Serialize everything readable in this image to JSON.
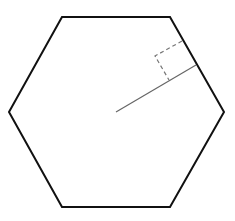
{
  "diagram": {
    "title": "",
    "shape": "regular-hexagon",
    "background": "#ffffff",
    "hexagon": {
      "vertices": [
        [
          62,
          17
        ],
        [
          170,
          17
        ],
        [
          224,
          112
        ],
        [
          170,
          207
        ],
        [
          62,
          207
        ],
        [
          9,
          112
        ]
      ],
      "stroke": "#111111",
      "stroke_width": 2
    },
    "apothem": {
      "from": [
        116,
        112
      ],
      "to": [
        196,
        65
      ],
      "stroke": "#666666",
      "stroke_width": 1.2
    },
    "right_angle_marker": {
      "points": [
        [
          182,
          41
        ],
        [
          155,
          56
        ],
        [
          169,
          80
        ]
      ],
      "stroke": "#777777",
      "stroke_width": 1.2,
      "dash": "4,3"
    }
  }
}
